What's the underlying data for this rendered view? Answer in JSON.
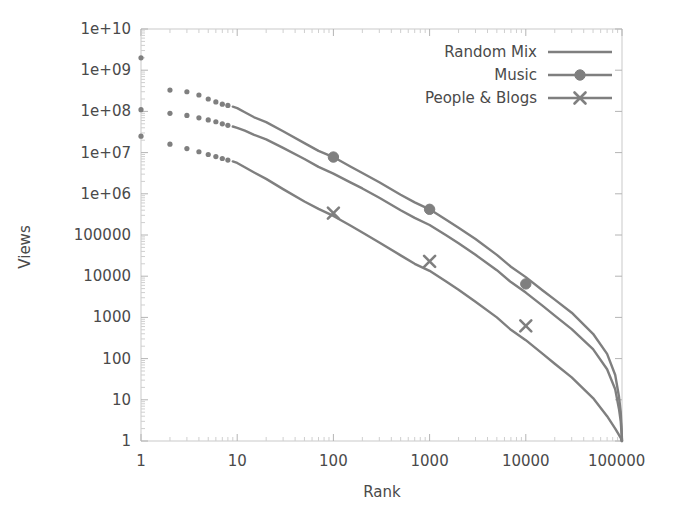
{
  "chart_data": {
    "type": "line",
    "title": "",
    "xlabel": "Rank",
    "ylabel": "Views",
    "xscale": "log",
    "yscale": "log",
    "xlim": [
      1,
      100000
    ],
    "ylim": [
      1,
      10000000000
    ],
    "grid": false,
    "legend_position": "top-right",
    "x_tick_labels": [
      "1",
      "10",
      "100",
      "1000",
      "10000",
      "100000"
    ],
    "x_tick_values": [
      1,
      10,
      100,
      1000,
      10000,
      100000
    ],
    "y_tick_labels": [
      "1",
      "10",
      "100",
      "1000",
      "10000",
      "100000",
      "1e+06",
      "1e+07",
      "1e+08",
      "1e+09",
      "1e+10"
    ],
    "y_tick_values": [
      1,
      10,
      100,
      1000,
      10000,
      100000,
      1000000,
      10000000,
      100000000,
      1000000000,
      10000000000
    ],
    "series": [
      {
        "name": "Random Mix",
        "marker": "none",
        "color": "#7f7f7f",
        "x": [
          1,
          2,
          3,
          4,
          5,
          6,
          7,
          8,
          9,
          10,
          12,
          15,
          20,
          30,
          50,
          70,
          100,
          150,
          200,
          300,
          500,
          700,
          1000,
          1500,
          2000,
          3000,
          5000,
          7000,
          10000,
          15000,
          20000,
          30000,
          50000,
          70000,
          85000,
          93000,
          97000,
          99000,
          100000
        ],
        "y": [
          2000000000,
          330000000,
          300000000,
          250000000,
          200000000,
          170000000,
          150000000,
          140000000,
          130000000,
          120000000,
          95000000,
          72000000,
          55000000,
          33000000,
          17000000,
          11000000,
          7800000,
          4600000,
          3200000,
          1900000,
          950000,
          620000,
          420000,
          230000,
          150000,
          80000,
          33000,
          17000,
          9500,
          4500,
          2700,
          1300,
          400,
          130,
          40,
          12,
          5,
          2,
          1
        ]
      },
      {
        "name": "Music",
        "marker": "circle",
        "color": "#7f7f7f",
        "marker_points": [
          {
            "x": 100,
            "y": 7800000
          },
          {
            "x": 1000,
            "y": 420000
          },
          {
            "x": 10000,
            "y": 6500
          }
        ],
        "x": [
          1,
          2,
          3,
          4,
          5,
          6,
          7,
          8,
          9,
          10,
          12,
          15,
          20,
          30,
          50,
          70,
          100,
          150,
          200,
          300,
          500,
          700,
          1000,
          1500,
          2000,
          3000,
          5000,
          7000,
          10000,
          15000,
          20000,
          30000,
          50000,
          70000,
          85000,
          93000,
          97000,
          99000,
          100000
        ],
        "y": [
          110000000,
          90000000,
          80000000,
          70000000,
          62000000,
          56000000,
          50000000,
          46000000,
          43000000,
          40000000,
          34000000,
          27000000,
          21000000,
          13000000,
          7000000,
          4500000,
          3100000,
          1900000,
          1350000,
          800000,
          400000,
          260000,
          175000,
          97000,
          63000,
          33000,
          14000,
          7200,
          4000,
          1900,
          1100,
          520,
          170,
          55,
          18,
          6,
          3,
          1.5,
          1
        ]
      },
      {
        "name": "People & Blogs",
        "marker": "x",
        "color": "#7f7f7f",
        "marker_points": [
          {
            "x": 100,
            "y": 340000
          },
          {
            "x": 1000,
            "y": 23000
          },
          {
            "x": 10000,
            "y": 620
          }
        ],
        "x": [
          1,
          2,
          3,
          4,
          5,
          6,
          7,
          8,
          9,
          10,
          12,
          15,
          20,
          30,
          50,
          70,
          100,
          150,
          200,
          300,
          500,
          700,
          1000,
          1500,
          2000,
          3000,
          5000,
          7000,
          10000,
          15000,
          20000,
          30000,
          50000,
          70000,
          85000,
          93000,
          97000,
          99000,
          100000
        ],
        "y": [
          25000000,
          16000000,
          12500000,
          10500000,
          9000000,
          8000000,
          7200000,
          6600000,
          6100000,
          5600000,
          4400000,
          3300000,
          2300000,
          1300000,
          650000,
          430000,
          290000,
          170000,
          115000,
          66000,
          32000,
          20000,
          13500,
          7300,
          4700,
          2400,
          1000,
          500,
          280,
          130,
          75,
          35,
          11,
          4,
          2,
          1.4,
          1.2,
          1,
          1
        ]
      }
    ]
  },
  "axes": {
    "xlabel": "Rank",
    "ylabel": "Views"
  },
  "legend": {
    "items": [
      {
        "label": "Random Mix",
        "marker": "none"
      },
      {
        "label": "Music",
        "marker": "circle"
      },
      {
        "label": "People & Blogs",
        "marker": "x"
      }
    ]
  },
  "style": {
    "line_color": "#7f7f7f",
    "frame_color": "#c9c9c9",
    "text_color": "#4a4a4a",
    "background": "#ffffff"
  }
}
